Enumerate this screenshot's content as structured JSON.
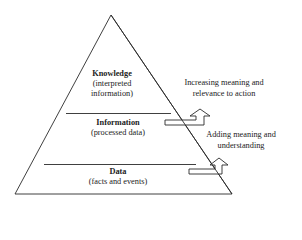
{
  "diagram": {
    "type": "pyramid",
    "levels": [
      {
        "title": "Knowledge",
        "subtitle_line1": "(interpreted",
        "subtitle_line2": "information)"
      },
      {
        "title": "Information",
        "subtitle_line1": "(processed data)"
      },
      {
        "title": "Data",
        "subtitle_line1": "(facts and events)"
      }
    ],
    "annotations": [
      {
        "line1": "Increasing meaning and",
        "line2": "relevance to action"
      },
      {
        "line1": "Adding meaning and",
        "line2": "understanding"
      }
    ],
    "colors": {
      "stroke": "#2a2a2a",
      "text": "#222222",
      "background": "#ffffff"
    }
  }
}
